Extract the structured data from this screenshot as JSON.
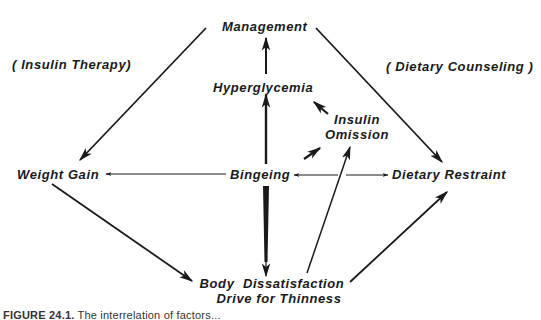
{
  "diagram": {
    "nodes": {
      "management": "Management",
      "hyperglycemia": "Hyperglycemia",
      "insulin_omission_line1": "Insulin",
      "insulin_omission_line2": "Omission",
      "weight_gain": "Weight Gain",
      "bingeing": "Bingeing",
      "dietary_restraint": "Dietary Restraint",
      "body_dissatisfaction_line1": "Body  Dissatisfaction",
      "body_dissatisfaction_line2": "Drive for Thinness"
    },
    "annotations": {
      "left": "( Insulin Therapy)",
      "right": "( Dietary Counseling )"
    },
    "edges": [
      {
        "from": "management",
        "to": "weight_gain",
        "label": "Insulin Therapy"
      },
      {
        "from": "management",
        "to": "dietary_restraint",
        "label": "Dietary Counseling"
      },
      {
        "from": "hyperglycemia",
        "to": "management"
      },
      {
        "from": "bingeing",
        "to": "hyperglycemia"
      },
      {
        "from": "bingeing",
        "to": "insulin_omission"
      },
      {
        "from": "insulin_omission",
        "to": "hyperglycemia"
      },
      {
        "from": "bingeing",
        "to": "weight_gain"
      },
      {
        "from": "bingeing",
        "to": "dietary_restraint",
        "bidirectional": true
      },
      {
        "from": "bingeing",
        "to": "body_dissatisfaction"
      },
      {
        "from": "weight_gain",
        "to": "body_dissatisfaction"
      },
      {
        "from": "body_dissatisfaction",
        "to": "insulin_omission"
      },
      {
        "from": "body_dissatisfaction",
        "to": "dietary_restraint"
      }
    ],
    "colors": {
      "ink": "#1a1a1a",
      "background": "#ffffff"
    }
  },
  "caption": {
    "label": "FIGURE 24.1.",
    "text": "The interrelation of factors..."
  }
}
